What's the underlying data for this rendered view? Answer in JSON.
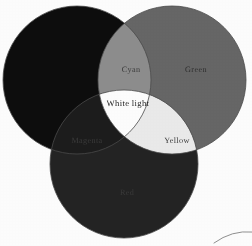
{
  "diagram": {
    "type": "venn",
    "background_color": "#ffffff",
    "rendering": "grayscale scan",
    "circles": [
      {
        "id": "blue",
        "label": "Blue",
        "label_visible": false,
        "cx": 77,
        "cy": 80,
        "r": 74,
        "fill": "#0d0d0d"
      },
      {
        "id": "green",
        "label": "Green",
        "label_visible": true,
        "cx": 172,
        "cy": 80,
        "r": 74,
        "fill": "#676767"
      },
      {
        "id": "red",
        "label": "Red",
        "label_visible": true,
        "cx": 124,
        "cy": 164,
        "r": 74,
        "fill": "#232323"
      }
    ],
    "regions": [
      {
        "id": "green-only",
        "label": "Green",
        "fill": "#676767",
        "text_color": "#2f2f2f",
        "label_x": 196,
        "label_y": 72
      },
      {
        "id": "blue-green",
        "label": "Cyan",
        "fill": "#8e8e8e",
        "text_color": "#3b3b3b",
        "label_x": 131,
        "label_y": 72
      },
      {
        "id": "blue-red",
        "label": "Magenta",
        "fill": "#1c1c1c",
        "text_color": "#3a3a3a",
        "label_x": 87,
        "label_y": 143
      },
      {
        "id": "green-red",
        "label": "Yellow",
        "fill": "#ececec",
        "text_color": "#3b3b3b",
        "label_x": 177,
        "label_y": 143
      },
      {
        "id": "all-three",
        "label": "White light",
        "fill": "#ffffff",
        "text_color": "#242424",
        "label_x": 128,
        "label_y": 106
      },
      {
        "id": "red-only",
        "label": "Red",
        "fill": "#232323",
        "text_color": "#3a3a3a",
        "label_x": 127,
        "label_y": 195
      },
      {
        "id": "blue-only",
        "label": "Blue",
        "fill": "#0d0d0d",
        "text_color": "#3a3a3a",
        "label_x": 0,
        "label_y": 0
      }
    ],
    "outline_color": "#4a4a4a",
    "artifact": {
      "id": "scan-curve",
      "description": "thin curved scan line at bottom-right corner",
      "color": "#6f6f6f"
    }
  }
}
